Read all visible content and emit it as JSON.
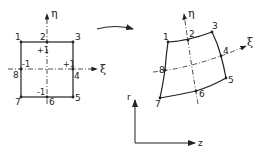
{
  "diagram": {
    "parent_element": {
      "axes": {
        "horizontal": "ξ",
        "vertical": "η"
      },
      "nodes": [
        {
          "id": "1",
          "x": 21,
          "y": 42
        },
        {
          "id": "2",
          "x": 47,
          "y": 42
        },
        {
          "id": "3",
          "x": 73,
          "y": 42
        },
        {
          "id": "4",
          "x": 73,
          "y": 69
        },
        {
          "id": "5",
          "x": 73,
          "y": 97
        },
        {
          "id": "6",
          "x": 47,
          "y": 97
        },
        {
          "id": "7",
          "x": 21,
          "y": 97
        },
        {
          "id": "8",
          "x": 21,
          "y": 69
        }
      ],
      "coord_marks": [
        {
          "text": "+1",
          "pos": "top"
        },
        {
          "text": "+1",
          "pos": "right"
        },
        {
          "text": "-1",
          "pos": "left"
        },
        {
          "text": "-1",
          "pos": "bottom"
        }
      ]
    },
    "mapped_element": {
      "axes": {
        "horizontal": "ξ",
        "vertical": "η"
      },
      "nodes": [
        {
          "id": "1",
          "x": 168,
          "y": 42
        },
        {
          "id": "2",
          "x": 188,
          "y": 40
        },
        {
          "id": "3",
          "x": 212,
          "y": 32
        },
        {
          "id": "4",
          "x": 221,
          "y": 56
        },
        {
          "id": "5",
          "x": 226,
          "y": 78
        },
        {
          "id": "6",
          "x": 196,
          "y": 91
        },
        {
          "id": "7",
          "x": 160,
          "y": 98
        },
        {
          "id": "8",
          "x": 165,
          "y": 70
        }
      ]
    },
    "global_axes": {
      "vertical": "r",
      "horizontal": "z"
    },
    "mapping_arrow": "curved-arrow"
  }
}
